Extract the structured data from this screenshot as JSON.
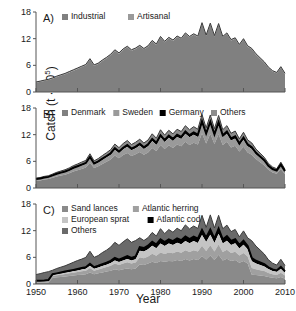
{
  "figure": {
    "axis_x_label": "Year",
    "axis_y_label_prefix": "Catch (t · 10",
    "axis_y_label_exponent": "5",
    "axis_y_label_suffix": ")",
    "background": "#ffffff"
  },
  "colors": {
    "series_gray": "#808080",
    "series_gray_light": "#9a9a9a",
    "series_gray_lighter": "#b5b5b5",
    "series_gray_pale": "#c8c8c8",
    "series_dark": "#6a6a6a",
    "series_black": "#000000",
    "axis": "#555555",
    "text": "#1a1a1a"
  },
  "panels": [
    {
      "tag": "A)",
      "legend": [
        {
          "label": "Industrial",
          "color": "#808080"
        },
        {
          "label": "Artisanal",
          "color": "#9a9a9a"
        }
      ]
    },
    {
      "tag": "B)",
      "legend": [
        {
          "label": "Denmark",
          "color": "#808080"
        },
        {
          "label": "Sweden",
          "color": "#9a9a9a"
        },
        {
          "label": "Germany",
          "color": "#000000"
        },
        {
          "label": "Others",
          "color": "#8c8c8c"
        }
      ]
    },
    {
      "tag": "C)",
      "legend": [
        {
          "label": "Sand lances",
          "color": "#8a8a8a"
        },
        {
          "label": "Atlantic herring",
          "color": "#a0a0a0"
        },
        {
          "label": "European sprat",
          "color": "#c4c4c4"
        },
        {
          "label": "Atlantic cod",
          "color": "#000000"
        },
        {
          "label": "Others",
          "color": "#6a6a6a"
        }
      ]
    }
  ],
  "chart_data": {
    "type": "area",
    "title": "",
    "xlabel": "Year",
    "ylabel": "Catch (t · 10^5)",
    "xlim": [
      1950,
      2010
    ],
    "ylim": [
      0,
      18
    ],
    "yticks": [
      0,
      6,
      12,
      18
    ],
    "xticks": [
      1950,
      1960,
      1970,
      1980,
      1990,
      2000,
      2010
    ],
    "xtick_labels": [
      "1950",
      "1960",
      "1970",
      "1980",
      "1990",
      "2000",
      "2010"
    ],
    "ytick_labels": [
      "0",
      "6",
      "12",
      "18"
    ],
    "grid": false,
    "legend_position": "top-left inside",
    "x": [
      1950,
      1951,
      1952,
      1953,
      1954,
      1955,
      1956,
      1957,
      1958,
      1959,
      1960,
      1961,
      1962,
      1963,
      1964,
      1965,
      1966,
      1967,
      1968,
      1969,
      1970,
      1971,
      1972,
      1973,
      1974,
      1975,
      1976,
      1977,
      1978,
      1979,
      1980,
      1981,
      1982,
      1983,
      1984,
      1985,
      1986,
      1987,
      1988,
      1989,
      1990,
      1991,
      1992,
      1993,
      1994,
      1995,
      1996,
      1997,
      1998,
      1999,
      2000,
      2001,
      2002,
      2003,
      2004,
      2005,
      2006,
      2007,
      2008,
      2009,
      2010
    ],
    "panels": [
      {
        "tag": "A)",
        "stacked": true,
        "series": [
          {
            "name": "Industrial",
            "color": "#808080",
            "values": [
              2.1,
              2.3,
              2.5,
              2.7,
              3.0,
              3.4,
              3.7,
              4.0,
              4.4,
              4.8,
              5.2,
              5.6,
              6.0,
              7.3,
              5.9,
              6.3,
              7.0,
              7.6,
              8.3,
              9.3,
              8.6,
              9.5,
              10.1,
              9.3,
              9.7,
              10.3,
              9.6,
              10.2,
              11.4,
              10.6,
              12.3,
              11.2,
              12.1,
              11.5,
              12.4,
              11.9,
              13.1,
              12.3,
              12.9,
              12.4,
              15.4,
              12.6,
              15.3,
              12.5,
              15.2,
              12.3,
              13.1,
              11.6,
              12.0,
              10.5,
              11.8,
              10.2,
              9.6,
              8.4,
              7.5,
              6.6,
              5.4,
              4.6,
              4.2,
              5.5,
              4.0
            ]
          },
          {
            "name": "Artisanal",
            "color": "#9a9a9a",
            "values": [
              0.15,
              0.15,
              0.16,
              0.16,
              0.17,
              0.17,
              0.18,
              0.18,
              0.19,
              0.19,
              0.2,
              0.2,
              0.2,
              0.2,
              0.2,
              0.2,
              0.2,
              0.2,
              0.2,
              0.2,
              0.2,
              0.2,
              0.2,
              0.2,
              0.2,
              0.2,
              0.2,
              0.2,
              0.2,
              0.2,
              0.2,
              0.2,
              0.2,
              0.2,
              0.2,
              0.2,
              0.2,
              0.2,
              0.2,
              0.2,
              0.2,
              0.2,
              0.2,
              0.2,
              0.2,
              0.2,
              0.2,
              0.2,
              0.2,
              0.2,
              0.2,
              0.2,
              0.2,
              0.2,
              0.2,
              0.2,
              0.2,
              0.2,
              0.2,
              0.2,
              0.2
            ]
          }
        ]
      },
      {
        "tag": "B)",
        "stacked": true,
        "series": [
          {
            "name": "Denmark",
            "color": "#808080",
            "values": [
              1.6,
              1.7,
              1.9,
              2.0,
              2.3,
              2.6,
              2.8,
              3.0,
              3.3,
              3.7,
              4.0,
              4.3,
              4.6,
              5.7,
              4.5,
              4.9,
              5.4,
              5.9,
              6.4,
              7.3,
              6.7,
              7.4,
              7.9,
              7.2,
              7.6,
              8.1,
              7.5,
              8.0,
              9.0,
              8.3,
              9.7,
              8.8,
              9.6,
              9.0,
              9.8,
              9.4,
              10.4,
              9.7,
              10.2,
              9.8,
              12.3,
              10.0,
              12.2,
              9.9,
              12.1,
              9.7,
              10.4,
              9.1,
              9.5,
              8.2,
              9.3,
              8.0,
              7.5,
              6.5,
              5.8,
              5.1,
              4.1,
              3.5,
              3.2,
              4.3,
              3.1
            ]
          },
          {
            "name": "Sweden",
            "color": "#9a9a9a",
            "values": [
              0.3,
              0.32,
              0.34,
              0.37,
              0.4,
              0.45,
              0.5,
              0.55,
              0.6,
              0.65,
              0.7,
              0.75,
              0.8,
              1.0,
              0.8,
              0.85,
              0.95,
              1.0,
              1.1,
              1.3,
              1.2,
              1.3,
              1.4,
              1.3,
              1.35,
              1.45,
              1.3,
              1.4,
              1.6,
              1.45,
              1.7,
              1.55,
              1.7,
              1.6,
              1.7,
              1.65,
              1.8,
              1.7,
              1.8,
              1.7,
              2.1,
              1.75,
              2.1,
              1.7,
              2.1,
              1.7,
              1.8,
              1.6,
              1.65,
              1.4,
              1.6,
              1.4,
              1.3,
              1.1,
              1.0,
              0.9,
              0.7,
              0.6,
              0.55,
              0.75,
              0.55
            ]
          },
          {
            "name": "Germany",
            "color": "#000000",
            "values": [
              0.12,
              0.12,
              0.13,
              0.13,
              0.14,
              0.15,
              0.16,
              0.17,
              0.18,
              0.2,
              0.2,
              0.22,
              0.23,
              0.28,
              0.23,
              0.25,
              0.27,
              0.3,
              0.32,
              0.36,
              0.33,
              0.37,
              0.39,
              0.36,
              0.38,
              0.4,
              0.37,
              0.4,
              0.45,
              0.41,
              0.48,
              0.44,
              0.48,
              0.45,
              0.49,
              0.47,
              0.52,
              0.48,
              0.51,
              0.49,
              0.6,
              0.5,
              0.6,
              0.49,
              0.6,
              0.48,
              0.52,
              0.45,
              0.47,
              0.41,
              0.46,
              0.4,
              0.37,
              0.32,
              0.29,
              0.25,
              0.2,
              0.17,
              0.16,
              0.21,
              0.15
            ]
          },
          {
            "name": "Others",
            "color": "#8c8c8c",
            "values": [
              0.2,
              0.22,
              0.24,
              0.26,
              0.3,
              0.33,
              0.36,
              0.39,
              0.43,
              0.47,
              0.5,
              0.55,
              0.58,
              0.72,
              0.57,
              0.62,
              0.68,
              0.74,
              0.81,
              0.92,
              0.85,
              0.93,
              1.0,
              0.91,
              0.96,
              1.02,
              0.95,
              1.0,
              1.14,
              1.04,
              1.22,
              1.1,
              1.2,
              1.13,
              1.23,
              1.18,
              1.3,
              1.22,
              1.29,
              1.24,
              1.54,
              1.26,
              1.53,
              1.25,
              1.52,
              1.23,
              1.31,
              1.16,
              1.2,
              1.05,
              1.18,
              1.02,
              0.96,
              0.84,
              0.75,
              0.66,
              0.54,
              0.46,
              0.42,
              0.55,
              0.4
            ]
          }
        ]
      },
      {
        "tag": "C)",
        "stacked": true,
        "series": [
          {
            "name": "Sand lances",
            "color": "#8a8a8a",
            "values": [
              0.3,
              0.3,
              0.3,
              0.35,
              1.4,
              1.5,
              1.6,
              1.7,
              1.8,
              1.9,
              2.0,
              2.1,
              2.2,
              2.6,
              2.2,
              2.4,
              2.6,
              2.8,
              3.0,
              3.3,
              3.1,
              3.3,
              3.5,
              3.3,
              3.5,
              4.4,
              4.3,
              4.6,
              5.0,
              4.7,
              5.2,
              5.0,
              5.2,
              5.1,
              5.4,
              5.2,
              5.6,
              5.3,
              5.6,
              5.4,
              6.3,
              5.5,
              6.4,
              5.4,
              6.6,
              5.3,
              5.7,
              5.2,
              5.4,
              4.8,
              5.2,
              4.6,
              2.1,
              2.0,
              1.9,
              1.8,
              1.6,
              1.4,
              1.3,
              1.6,
              1.2
            ]
          },
          {
            "name": "Atlantic herring",
            "color": "#a0a0a0",
            "values": [
              0.2,
              0.2,
              0.22,
              0.25,
              0.4,
              0.45,
              0.5,
              0.55,
              0.6,
              0.65,
              0.7,
              0.75,
              0.8,
              1.0,
              0.8,
              0.85,
              0.95,
              1.0,
              1.1,
              1.3,
              1.2,
              1.3,
              1.4,
              1.3,
              1.35,
              1.6,
              1.5,
              1.6,
              1.8,
              1.65,
              1.9,
              1.75,
              1.9,
              1.8,
              1.9,
              1.85,
              2.0,
              1.9,
              2.0,
              1.9,
              2.3,
              1.95,
              2.3,
              1.9,
              2.3,
              1.9,
              2.0,
              1.8,
              1.85,
              1.6,
              1.8,
              1.6,
              1.5,
              1.3,
              1.2,
              1.1,
              0.9,
              0.8,
              0.75,
              0.95,
              0.7
            ]
          },
          {
            "name": "European sprat",
            "color": "#c4c4c4",
            "values": [
              0.1,
              0.1,
              0.12,
              0.13,
              0.2,
              0.22,
              0.25,
              0.28,
              0.3,
              0.33,
              0.36,
              0.4,
              0.42,
              0.52,
              0.42,
              0.45,
              0.5,
              0.55,
              0.6,
              0.7,
              0.65,
              0.7,
              0.75,
              0.7,
              0.73,
              1.5,
              1.5,
              1.6,
              1.8,
              1.7,
              2.0,
              1.8,
              2.0,
              1.85,
              2.0,
              1.9,
              2.1,
              1.95,
              2.05,
              1.95,
              2.4,
              2.0,
              2.4,
              1.95,
              2.4,
              1.9,
              2.05,
              1.8,
              1.9,
              1.6,
              1.85,
              1.6,
              1.5,
              1.3,
              1.2,
              1.05,
              0.85,
              0.75,
              0.7,
              0.9,
              0.65
            ]
          },
          {
            "name": "Atlantic cod",
            "color": "#000000",
            "values": [
              0.12,
              0.13,
              0.14,
              0.15,
              0.2,
              0.22,
              0.24,
              0.26,
              0.28,
              0.3,
              0.32,
              0.35,
              0.37,
              0.45,
              0.37,
              0.4,
              0.43,
              0.47,
              0.51,
              0.58,
              0.54,
              0.58,
              0.62,
              0.57,
              0.6,
              0.8,
              0.78,
              0.82,
              0.9,
              0.84,
              0.95,
              0.88,
              0.95,
              0.9,
              0.95,
              0.92,
              1.0,
              0.95,
              1.0,
              0.95,
              1.15,
              0.98,
              1.15,
              0.95,
              1.15,
              0.93,
              1.0,
              0.88,
              0.92,
              0.8,
              0.9,
              0.78,
              0.72,
              0.63,
              0.56,
              0.5,
              0.4,
              0.34,
              0.31,
              0.4,
              0.3
            ]
          },
          {
            "name": "Others",
            "color": "#6a6a6a",
            "values": [
              1.4,
              1.6,
              1.8,
              1.9,
              0.9,
              1.1,
              1.2,
              1.3,
              1.5,
              1.7,
              1.9,
              2.0,
              2.2,
              2.8,
              2.2,
              2.3,
              2.6,
              2.8,
              3.1,
              3.5,
              3.2,
              3.6,
              3.9,
              3.5,
              3.6,
              2.1,
              1.7,
              1.8,
              2.1,
              1.9,
              2.4,
              1.9,
              2.2,
              2.0,
              2.3,
              2.1,
              2.6,
              2.3,
              2.4,
              2.3,
              3.3,
              2.3,
              3.3,
              2.4,
              3.0,
              2.4,
              2.5,
              2.1,
              2.2,
              1.8,
              2.2,
              1.8,
              3.9,
              3.3,
              2.8,
              2.3,
              1.7,
              1.4,
              1.2,
              1.7,
              1.3
            ]
          }
        ]
      }
    ]
  }
}
